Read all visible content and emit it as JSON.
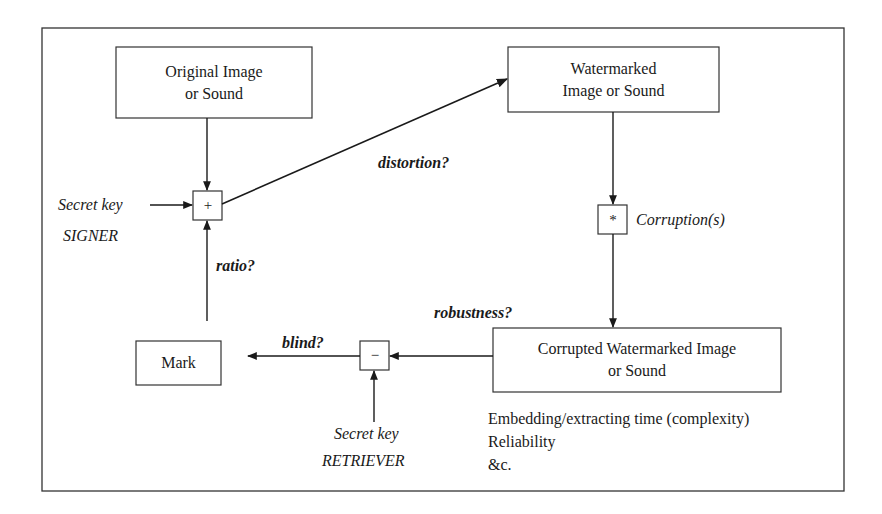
{
  "diagram": {
    "nodes": {
      "original": {
        "line1": "Original Image",
        "line2": "or Sound"
      },
      "watermarked": {
        "line1": "Watermarked",
        "line2": "Image or Sound"
      },
      "corrupted": {
        "line1": "Corrupted Watermarked Image",
        "line2": "or Sound"
      },
      "mark": {
        "label": "Mark"
      }
    },
    "operators": {
      "embed": "+",
      "corrupt": "*",
      "extract": "−"
    },
    "labels": {
      "secret_key_signer": "Secret key",
      "signer": "SIGNER",
      "secret_key_retriever": "Secret key",
      "retriever": "RETRIEVER",
      "corruptions": "Corruption(s)"
    },
    "questions": {
      "distortion": "distortion?",
      "ratio": "ratio?",
      "robustness": "robustness?",
      "blind": "blind?"
    },
    "notes": [
      "Embedding/extracting time (complexity)",
      "Reliability",
      "&c."
    ]
  }
}
